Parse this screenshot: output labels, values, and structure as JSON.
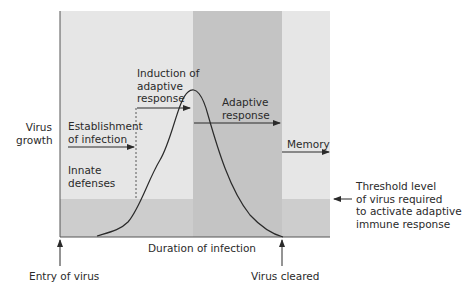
{
  "diagram": {
    "y_axis_label_line1": "Virus",
    "y_axis_label_line2": "growth",
    "x_axis_label": "Duration of infection",
    "phases": {
      "establishment_line1": "Establishment",
      "establishment_line2": "of infection",
      "innate_line1": "Innate",
      "innate_line2": "defenses",
      "induction_line1": "Induction of",
      "induction_line2": "adaptive",
      "induction_line3": "response",
      "adaptive_line1": "Adaptive",
      "adaptive_line2": "response",
      "memory": "Memory"
    },
    "threshold_line1": "Threshold level",
    "threshold_line2": "of virus required",
    "threshold_line3": "to activate adaptive",
    "threshold_line4": "immune response",
    "entry_label": "Entry of virus",
    "cleared_label": "Virus cleared",
    "colors": {
      "light_region": "#e6e6e6",
      "dark_region": "#c4c4c4",
      "below_threshold": "#cdcdcd",
      "curve": "#2a2a2a"
    }
  }
}
